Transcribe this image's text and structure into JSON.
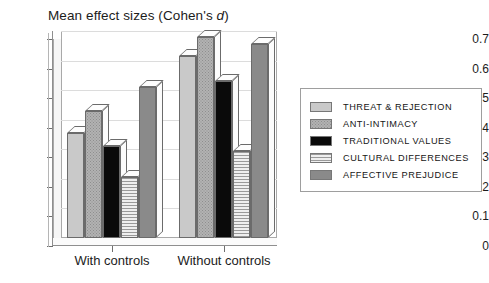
{
  "chart_data": {
    "type": "bar",
    "title": "Mean effect sizes (Cohen's d)",
    "title_plain": "Mean effect sizes (Cohen's ",
    "title_italic": "d",
    "title_tail": ")",
    "xlabel": "",
    "ylabel": "",
    "ylim": [
      0,
      0.7
    ],
    "ytick_labels": [
      "0",
      "0.1",
      "0.2",
      "0.3",
      "0.4",
      "0.5",
      "0.6",
      "0.7"
    ],
    "ytick_values": [
      0,
      0.1,
      0.2,
      0.3,
      0.4,
      0.5,
      0.6,
      0.7
    ],
    "grid": true,
    "legend_position": "right",
    "categories": [
      "With controls",
      "Without controls"
    ],
    "series": [
      {
        "name": "THREAT & REJECTION",
        "values": [
          0.355,
          0.615
        ],
        "swatch": "fill-threat"
      },
      {
        "name": "ANTI-INTIMACY",
        "values": [
          0.43,
          0.68
        ],
        "swatch": "fill-anti"
      },
      {
        "name": "TRADITIONAL VALUES",
        "values": [
          0.31,
          0.53
        ],
        "swatch": "fill-trad"
      },
      {
        "name": "CULTURAL DIFFERENCES",
        "values": [
          0.205,
          0.295
        ],
        "swatch": "fill-cult"
      },
      {
        "name": "AFFECTIVE PREJUDICE",
        "values": [
          0.51,
          0.655
        ],
        "swatch": "fill-affect"
      }
    ]
  },
  "legend": {
    "items": [
      "THREAT & REJECTION",
      "ANTI-INTIMACY",
      "TRADITIONAL VALUES",
      "CULTURAL DIFFERENCES",
      "AFFECTIVE PREJUDICE"
    ]
  }
}
